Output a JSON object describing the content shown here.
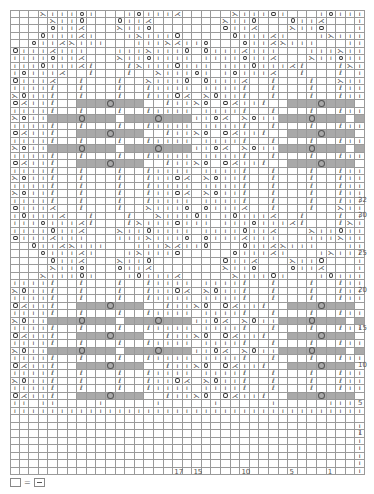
{
  "chart_data": {
    "type": "table",
    "columns": 37,
    "rows_count": 62,
    "repeat_note": "Two repeats of lace/twisted-stitch motif; grey cells = no stitch; circled grey = bobble/cluster",
    "row_labels": [
      {
        "label": "32",
        "row_from_top": 24
      },
      {
        "label": "30",
        "row_from_top": 26
      },
      {
        "label": "25",
        "row_from_top": 31
      },
      {
        "label": "20",
        "row_from_top": 36
      },
      {
        "label": "15",
        "row_from_top": 41
      },
      {
        "label": "10",
        "row_from_top": 46
      },
      {
        "label": "5",
        "row_from_top": 51
      },
      {
        "label": "1",
        "row_from_top": 55
      }
    ],
    "col_labels": [
      {
        "label": "17",
        "col": 17
      },
      {
        "label": "15",
        "col": 19
      },
      {
        "label": "10",
        "col": 24
      },
      {
        "label": "5",
        "col": 29
      },
      {
        "label": "1",
        "col": 33
      }
    ],
    "symbols": {
      ".": "empty",
      "|": "knit",
      "o": "yarn over",
      "/": "k2tog",
      "\\": "ssk",
      "t": "twisted stitch",
      "*": "bobble",
      "g": "no stitch (grey)",
      "G": "cluster (grey with circle)"
    },
    "grid": [
      "...\\|||o|...|o|||/.....\\|||o|...|o|||/.....*..|.",
      "....\\||o...o||/.......\\||o...o||/........|.",
      "....o||/...\\||o.......o||/...\\||o........|.",
      "...o|||/|...|\\|||o.....o|||/|...|\\|||o....|.",
      "..o||/\\|||...|||\\/||o...o||/\\|||...|||\\/||o..|.",
      "o|||/|||...|||\\|||o.o|||/|||...|||\\|||o.|.",
      "||||o||/...\\||o||||.||||o||/...\\||o||||.|.",
      "|||o|||/t...t\\|||o|||.|||o|||/t...t\\|||o|||.|.",
      "|o|||/..t...t..\\|||o|.|o|||/..t...t..\\|||o|.|.",
      "o|||/..t...t..\\|||o.o|||/..t...t..\\|||o.|.",
      "||||t..t...t..t||||.||||t..t...t..t||||.|.",
      "\\o||t..t...t..t||o/.\\o||t..t...t..t||o/.|.",
      "||||t..gggGggg..t||||.||||t..gggGggg..t||||.|."
    ]
  },
  "legend": {
    "blank_label": "=",
    "meaning": "blank square = purl"
  }
}
